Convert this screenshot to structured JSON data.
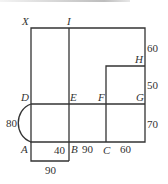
{
  "figure": {
    "type": "geometry floor-plan diagram",
    "points": {
      "X": "X",
      "I": "I",
      "H": "H",
      "D": "D",
      "E": "E",
      "F": "F",
      "G": "G",
      "A": "A",
      "B": "B",
      "C": "C"
    },
    "measurements": {
      "right_top": "60",
      "right_middle": "50",
      "right_bottom": "70",
      "left_arc": "80",
      "ab_inner": "40",
      "bc": "90",
      "c_right": "60",
      "bottom_rect": "90"
    },
    "colors": {
      "line": "#333333",
      "background": "#ffffff"
    }
  }
}
